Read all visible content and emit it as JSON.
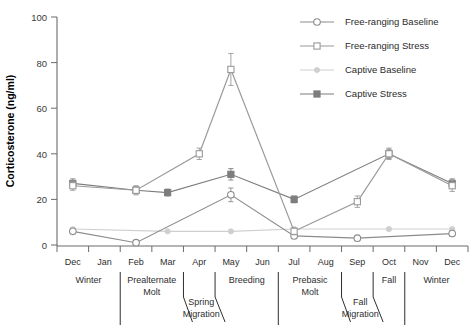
{
  "chart_data": {
    "type": "line",
    "title": "",
    "xlabel": "",
    "ylabel": "Corticosterone (ng/ml)",
    "ylim": [
      0,
      100
    ],
    "yticks": [
      0,
      20,
      40,
      60,
      80,
      100
    ],
    "grid": false,
    "legend_position": "top-right",
    "categories": [
      "Dec",
      "Jan",
      "Feb",
      "Mar",
      "Apr",
      "May",
      "Jun",
      "Jul",
      "Aug",
      "Sep",
      "Oct",
      "Nov",
      "Dec"
    ],
    "series": [
      {
        "name": "Free-ranging Baseline",
        "marker": "open-circle",
        "color": "#8c8c8c",
        "x": [
          "Dec",
          "Feb",
          "May",
          "Jul",
          "Sep",
          "Dec"
        ],
        "values": [
          6,
          1,
          22,
          4,
          3,
          5
        ],
        "errors": [
          1,
          0.5,
          3,
          1,
          0.5,
          1
        ]
      },
      {
        "name": "Free-ranging Stress",
        "marker": "open-square",
        "color": "#9a9a9a",
        "x": [
          "Dec",
          "Feb",
          "Apr",
          "May",
          "Jul",
          "Sep",
          "Oct",
          "Dec"
        ],
        "values": [
          26,
          24,
          40,
          77,
          6,
          19,
          40,
          26
        ],
        "errors": [
          2,
          2,
          2.5,
          7,
          1.5,
          2.5,
          2.5,
          2.5
        ]
      },
      {
        "name": "Captive Baseline",
        "marker": "filled-dot-light",
        "color": "#cfcfcf",
        "x": [
          "Dec",
          "Mar",
          "May",
          "Jul",
          "Oct",
          "Dec"
        ],
        "values": [
          7,
          6,
          6,
          7,
          7,
          7
        ],
        "errors": [
          0.5,
          0.5,
          0.5,
          0.5,
          0.5,
          0.5
        ]
      },
      {
        "name": "Captive Stress",
        "marker": "filled-square",
        "color": "#7d7d7d",
        "x": [
          "Dec",
          "Feb",
          "Mar",
          "May",
          "Jul",
          "Oct",
          "Dec"
        ],
        "values": [
          27,
          24,
          23,
          31,
          20,
          40,
          27
        ],
        "errors": [
          2,
          1.5,
          1.5,
          2.5,
          1.5,
          2,
          2
        ]
      }
    ],
    "seasons": [
      {
        "label": "Winter",
        "line1": "Winter",
        "line2": ""
      },
      {
        "label": "Prealternate Molt",
        "line1": "Prealternate",
        "line2": "Molt"
      },
      {
        "label": "Spring Migration",
        "line1": "Spring",
        "line2": "Migration"
      },
      {
        "label": "Breeding",
        "line1": "Breeding",
        "line2": ""
      },
      {
        "label": "Prebasic Molt",
        "line1": "Prebasic",
        "line2": "Molt"
      },
      {
        "label": "Fall Migration",
        "line1": "Fall",
        "line2": "Migration"
      },
      {
        "label": "Fall",
        "line1": "Fall",
        "line2": ""
      },
      {
        "label": "Winter",
        "line1": "Winter",
        "line2": ""
      }
    ]
  },
  "legend": {
    "items": [
      {
        "label": "Free-ranging Baseline"
      },
      {
        "label": "Free-ranging Stress"
      },
      {
        "label": "Captive Baseline"
      },
      {
        "label": "Captive Stress"
      }
    ]
  },
  "yaxis": {
    "title": "Corticosterone (ng/ml)",
    "labels": [
      "100",
      "80",
      "60",
      "40",
      "20",
      "0"
    ]
  },
  "xaxis": {
    "months": [
      "Dec",
      "Jan",
      "Feb",
      "Mar",
      "Apr",
      "May",
      "Jun",
      "Jul",
      "Aug",
      "Sep",
      "Oct",
      "Nov",
      "Dec"
    ]
  },
  "season_labels": {
    "winter1": "Winter",
    "prealternate1": "Prealternate",
    "prealternate2": "Molt",
    "spring1": "Spring",
    "spring2": "Migration",
    "breeding": "Breeding",
    "prebasic1": "Prebasic",
    "prebasic2": "Molt",
    "fallmig1": "Fall",
    "fallmig2": "Migration",
    "fall": "Fall",
    "winter2": "Winter"
  }
}
